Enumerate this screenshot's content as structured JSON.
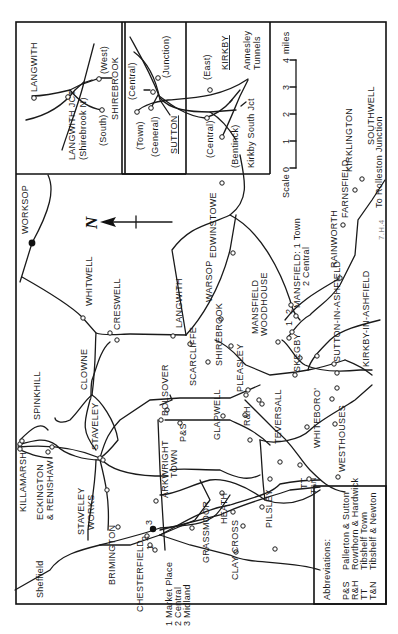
{
  "map": {
    "orientation": "rotated 90deg counter-clockwise (north arrow points left)",
    "north_symbol": "N",
    "stations": [
      "WORKSOP",
      "WHITWELL",
      "CRESWELL",
      "CLOWNE",
      "SPINKHILL",
      "KILLAMARSH",
      "ECKINGTON & RENISHAW",
      "STAVELEY",
      "STAVELEY WORKS",
      "BRIMINGTON",
      "CHESTERFIELD",
      "BOLSOVER",
      "P&S",
      "ARKWRIGHT TOWN",
      "GRASSMOOR",
      "CLAY CROSS",
      "HEATH",
      "PILSLEY",
      "GLAPWELL",
      "R&H",
      "SCARCLIFFE",
      "LANGWITH",
      "SHIREBROOK",
      "WARSOP",
      "EDWINSTOWE",
      "MANSFIELD WOODHOUSE",
      "MANSFIELD: 1 Town 2 Central",
      "PLEASLEY",
      "TEVERSALL",
      "SKEGBY",
      "WHITEBORO'",
      "TT",
      "T&N",
      "WESTHOUSES",
      "SUTTON-IN-ASHFIELD",
      "KIRKBY-IN-ASHFIELD",
      "RAINWORTH",
      "FARNSFIELD",
      "KIRKLINGTON",
      "SOUTHWELL"
    ],
    "destinations": {
      "sheffield": "Sheffield",
      "rolleston": "To Rolleston Junction"
    },
    "chesterfield_key": {
      "1": "Market Place",
      "2": "Central",
      "3": "Midland"
    },
    "mansfield_key": {
      "1": "Town",
      "2": "Central"
    },
    "numerals": [
      "1",
      "2",
      "3"
    ],
    "credit": "7.H.4"
  },
  "inset_langwith": {
    "labels": {
      "langwith": "LANGWITH",
      "jct": "LANGWITH JCT",
      "shirebrook_n": "(Shirebrook N)",
      "west": "(West)",
      "south": "(South)",
      "shirebrook": "SHIREBROOK"
    }
  },
  "inset_sutton_kirkby": {
    "labels": {
      "central1": "(Central)",
      "junction": "(Junction)",
      "town": "(Town)",
      "general": "(General)",
      "sutton": "SUTTON",
      "east": "(East)",
      "kirkby": "KIRKBY",
      "annesley": "Annesley",
      "tunnels": "Tunnels",
      "central2": "(Central)",
      "bentinck": "(Bentinck)",
      "kirkby_south_jct": "Kirkby South Jct"
    }
  },
  "scale": {
    "title": "Scale",
    "unit": "miles",
    "ticks": [
      "0",
      "1",
      "2",
      "3",
      "4"
    ]
  },
  "abbreviations": {
    "title": "Abbreviations:",
    "items": [
      {
        "abbr": "P&S",
        "full": "Pallerton & Sutton"
      },
      {
        "abbr": "R&H",
        "full": "Rowthorn & Hardwick"
      },
      {
        "abbr": "TT",
        "full": "Tibshelf Town"
      },
      {
        "abbr": "T&N",
        "full": "Tibshelf & Newton"
      }
    ]
  }
}
